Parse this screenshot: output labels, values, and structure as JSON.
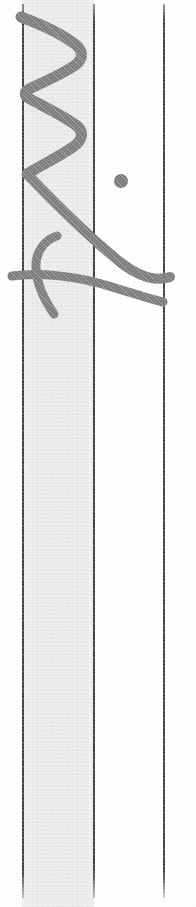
{
  "document": {
    "kind": "scanned-form-fragment",
    "description": "Narrow vertical slice of a scanned ruled form with a handwritten signature crossing the left column",
    "width": 196,
    "height": 907,
    "paper_color": "#fefefe",
    "ink_color": "#7b7b7b",
    "rule_color": "#3a3a3a",
    "shade_color": "#ececec"
  },
  "columns": [
    {
      "name": "left-margin-strip",
      "label": "Left margin strip",
      "x": 0,
      "width": 22,
      "fill": "#fefefe"
    },
    {
      "name": "shaded-column",
      "label": "Shaded column",
      "x": 22,
      "width": 72,
      "fill": "#ececec"
    },
    {
      "name": "white-column",
      "label": "White column",
      "x": 94,
      "width": 70,
      "fill": "#fefefe"
    },
    {
      "name": "right-margin-strip",
      "label": "Right margin strip",
      "x": 164,
      "width": 32,
      "fill": "#fefefe"
    }
  ],
  "rules": [
    {
      "name": "rule-left",
      "label": "Left vertical rule",
      "x": 22,
      "y": 4,
      "height": 894,
      "thickness": 2,
      "color": "#3a3a3a"
    },
    {
      "name": "rule-middle",
      "label": "Middle vertical rule",
      "x": 93,
      "y": 4,
      "height": 894,
      "thickness": 2,
      "color": "#3a3a3a"
    },
    {
      "name": "rule-right",
      "label": "Right vertical rule",
      "x": 163,
      "y": 4,
      "height": 894,
      "thickness": 2,
      "color": "#3a3a3a"
    }
  ],
  "handwriting": {
    "name": "signature",
    "label": "Handwritten signature",
    "ink_color": "#7b7b7b",
    "strokes": [
      {
        "name": "zigzag-stroke",
        "label": "Upper zigzag flourish",
        "width": 11,
        "path": "M 21 17 C 40 24, 62 34, 76 45 C 84 52, 83 60, 74 66 C 62 74, 44 82, 31 88 C 24 91, 23 95, 30 99 C 45 107, 66 117, 77 126 C 84 132, 83 140, 73 147 C 60 156, 40 166, 27 174"
      },
      {
        "name": "descender-stroke",
        "label": "Long descending diagonal stroke",
        "width": 10,
        "path": "M 27 174 C 50 198, 88 236, 120 262 C 138 276, 155 282, 170 277"
      },
      {
        "name": "loop-stroke",
        "label": "Lower loop flourish",
        "width": 9,
        "path": "M 57 236 C 44 240, 35 253, 36 268 C 37 287, 47 304, 54 314"
      },
      {
        "name": "crossbar-stroke",
        "label": "Horizontal crossbar stroke",
        "width": 9,
        "path": "M 12 276 C 38 272, 78 276, 112 287 C 132 293, 150 299, 163 302"
      }
    ],
    "blot": {
      "name": "ink-blot",
      "label": "Round ink dot",
      "cx": 121,
      "cy": 181,
      "r": 7,
      "color": "#787878"
    }
  }
}
